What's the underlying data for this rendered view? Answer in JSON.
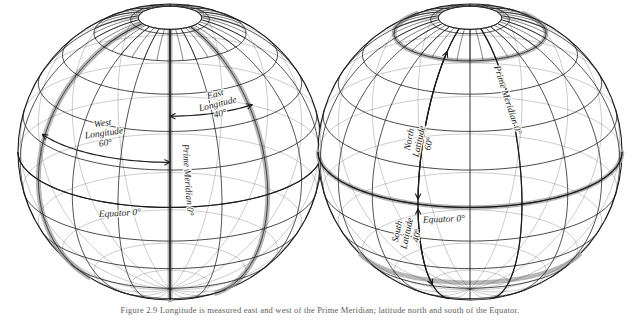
{
  "figure": {
    "background_color": "#ffffff",
    "line_color": "#1b1b1b",
    "highlight_color": "#a9a9a9",
    "text_color": "#1b1b1b"
  },
  "caption": {
    "text": "Figure 2.9  Longitude is measured east and west of the Prime Meridian; latitude north and south of the Equator."
  },
  "globes": [
    {
      "id": "longitude-globe",
      "name": "longitude-globe",
      "cx": 170,
      "cy": 152,
      "rx": 152,
      "ry": 148,
      "pole_cap_label": "north-pole-cap",
      "labels": [
        {
          "name": "west-longitude-label",
          "lines": [
            "West",
            "Longitude",
            "60°"
          ],
          "x": 103,
          "y": 126,
          "rotate": -8,
          "size": 9.5
        },
        {
          "name": "east-longitude-label",
          "lines": [
            "East",
            "Longitude",
            "40°"
          ],
          "x": 216,
          "y": 97,
          "rotate": -14,
          "size": 9.5
        },
        {
          "name": "prime-meridian-label-left",
          "lines": [
            "Prime Meridian  0°"
          ],
          "x": 185,
          "y": 180,
          "rotate": 86,
          "size": 9.5
        },
        {
          "name": "equator-label-left",
          "lines": [
            "Equator 0°"
          ],
          "x": 120,
          "y": 216,
          "rotate": -3,
          "size": 9.5
        }
      ],
      "arrows": [
        {
          "name": "west-longitude-arrow",
          "direction": "west-to-prime"
        },
        {
          "name": "east-longitude-arrow",
          "direction": "prime-to-east"
        }
      ],
      "highlight_bands": [
        {
          "name": "prime-meridian-band",
          "type": "meridian",
          "longitude": 0
        },
        {
          "name": "west-60-meridian-band",
          "type": "meridian",
          "longitude": -60
        },
        {
          "name": "east-40-meridian-band",
          "type": "meridian",
          "longitude": 40
        }
      ]
    },
    {
      "id": "latitude-globe",
      "name": "latitude-globe",
      "cx": 470,
      "cy": 152,
      "rx": 152,
      "ry": 148,
      "pole_cap_label": "north-pole-cap",
      "labels": [
        {
          "name": "north-latitude-label",
          "lines": [
            "North",
            "Latitude",
            "60°"
          ],
          "x": 412,
          "y": 140,
          "rotate": -78,
          "size": 9.5
        },
        {
          "name": "south-latitude-label",
          "lines": [
            "South",
            "Latitude",
            "40°"
          ],
          "x": 400,
          "y": 232,
          "rotate": -78,
          "size": 9.5
        },
        {
          "name": "prime-meridian-label-right",
          "lines": [
            "Prime Meridian  0°"
          ],
          "x": 505,
          "y": 101,
          "rotate": 72,
          "size": 9.5
        },
        {
          "name": "equator-label-right",
          "lines": [
            "Equator 0°"
          ],
          "x": 444,
          "y": 222,
          "rotate": -2,
          "size": 9.5
        }
      ],
      "arrows": [
        {
          "name": "north-latitude-arrow",
          "direction": "equator-to-north"
        },
        {
          "name": "south-latitude-arrow",
          "direction": "equator-to-south"
        }
      ],
      "highlight_bands": [
        {
          "name": "equator-band",
          "type": "parallel",
          "latitude": 0
        },
        {
          "name": "north-60-parallel-band",
          "type": "parallel",
          "latitude": 60
        },
        {
          "name": "south-40-parallel-band",
          "type": "parallel",
          "latitude": -40
        }
      ]
    }
  ],
  "graticule": {
    "meridian_step_deg": 20,
    "parallel_step_deg": 15,
    "view_tilt_deg": 22
  }
}
